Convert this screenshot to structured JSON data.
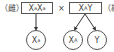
{
  "cross": {
    "female_label": "（雌）",
    "male_label": "（雄",
    "cross_symbol": "×",
    "parent_female": {
      "base1": "X",
      "sup1": "a",
      "base2": "X",
      "sup2": "a"
    },
    "parent_male": {
      "base1": "X",
      "sup1": "A",
      "base2": "Y"
    }
  },
  "gametes": [
    {
      "base": "X",
      "sup": "a"
    },
    {
      "base": "X",
      "sup": "A"
    },
    {
      "base": "Y",
      "sup": ""
    }
  ],
  "colors": {
    "stroke": "#555555",
    "text": "#444444",
    "background": "#ffffff"
  }
}
